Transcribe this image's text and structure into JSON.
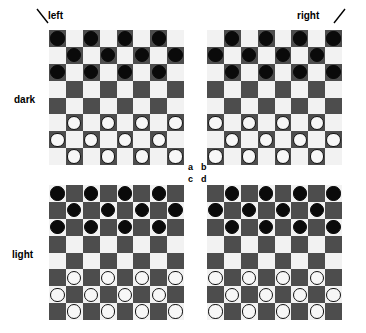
{
  "figure": {
    "row_labels": [
      "dark",
      "light"
    ],
    "col_labels": [
      "left",
      "right"
    ],
    "quadrant_labels": [
      "a",
      "b",
      "c",
      "d"
    ],
    "colors": {
      "light_square": "#f2f2f2",
      "dark_square": "#4d4d4d",
      "black_piece": "#0a0a0a",
      "white_piece": "#f7f7f7",
      "piece_outline": "#111111",
      "background": "#ffffff",
      "text": "#000000"
    }
  },
  "boards": [
    {
      "id": "a",
      "row_group": "dark",
      "col_group": "left",
      "size": 8,
      "corner_square": "dark",
      "squares": [
        [
          "dark",
          "light",
          "dark",
          "light",
          "dark",
          "light",
          "dark",
          "light"
        ],
        [
          "light",
          "dark",
          "light",
          "dark",
          "light",
          "dark",
          "light",
          "dark"
        ],
        [
          "dark",
          "light",
          "dark",
          "light",
          "dark",
          "light",
          "dark",
          "light"
        ],
        [
          "light",
          "dark",
          "light",
          "dark",
          "light",
          "dark",
          "light",
          "dark"
        ],
        [
          "dark",
          "light",
          "dark",
          "light",
          "dark",
          "light",
          "dark",
          "light"
        ],
        [
          "light",
          "dark",
          "light",
          "dark",
          "light",
          "dark",
          "light",
          "dark"
        ],
        [
          "dark",
          "light",
          "dark",
          "light",
          "dark",
          "light",
          "dark",
          "light"
        ],
        [
          "light",
          "dark",
          "light",
          "dark",
          "light",
          "dark",
          "light",
          "dark"
        ]
      ],
      "pieces": [
        [
          "black",
          "",
          "black",
          "",
          "black",
          "",
          "black",
          ""
        ],
        [
          "",
          "black",
          "",
          "black",
          "",
          "black",
          "",
          "black"
        ],
        [
          "black",
          "",
          "black",
          "",
          "black",
          "",
          "black",
          ""
        ],
        [
          "",
          "",
          "",
          "",
          "",
          "",
          "",
          ""
        ],
        [
          "",
          "",
          "",
          "",
          "",
          "",
          "",
          ""
        ],
        [
          "",
          "white",
          "",
          "white",
          "",
          "white",
          "",
          "white"
        ],
        [
          "white",
          "",
          "white",
          "",
          "white",
          "",
          "white",
          ""
        ],
        [
          "",
          "white",
          "",
          "white",
          "",
          "white",
          "",
          "white"
        ]
      ]
    },
    {
      "id": "b",
      "row_group": "dark",
      "col_group": "right",
      "size": 8,
      "corner_square": "light",
      "squares": [
        [
          "light",
          "dark",
          "light",
          "dark",
          "light",
          "dark",
          "light",
          "dark"
        ],
        [
          "dark",
          "light",
          "dark",
          "light",
          "dark",
          "light",
          "dark",
          "light"
        ],
        [
          "light",
          "dark",
          "light",
          "dark",
          "light",
          "dark",
          "light",
          "dark"
        ],
        [
          "dark",
          "light",
          "dark",
          "light",
          "dark",
          "light",
          "dark",
          "light"
        ],
        [
          "light",
          "dark",
          "light",
          "dark",
          "light",
          "dark",
          "light",
          "dark"
        ],
        [
          "dark",
          "light",
          "dark",
          "light",
          "dark",
          "light",
          "dark",
          "light"
        ],
        [
          "light",
          "dark",
          "light",
          "dark",
          "light",
          "dark",
          "light",
          "dark"
        ],
        [
          "dark",
          "light",
          "dark",
          "light",
          "dark",
          "light",
          "dark",
          "light"
        ]
      ],
      "pieces": [
        [
          "",
          "black",
          "",
          "black",
          "",
          "black",
          "",
          "black"
        ],
        [
          "black",
          "",
          "black",
          "",
          "black",
          "",
          "black",
          ""
        ],
        [
          "",
          "black",
          "",
          "black",
          "",
          "black",
          "",
          "black"
        ],
        [
          "",
          "",
          "",
          "",
          "",
          "",
          "",
          ""
        ],
        [
          "",
          "",
          "",
          "",
          "",
          "",
          "",
          ""
        ],
        [
          "white",
          "",
          "white",
          "",
          "white",
          "",
          "white",
          ""
        ],
        [
          "",
          "white",
          "",
          "white",
          "",
          "white",
          "",
          "white"
        ],
        [
          "white",
          "",
          "white",
          "",
          "white",
          "",
          "white",
          ""
        ]
      ]
    },
    {
      "id": "c",
      "row_group": "light",
      "col_group": "left",
      "size": 8,
      "corner_square": "light",
      "squares": [
        [
          "light",
          "dark",
          "light",
          "dark",
          "light",
          "dark",
          "light",
          "dark"
        ],
        [
          "dark",
          "light",
          "dark",
          "light",
          "dark",
          "light",
          "dark",
          "light"
        ],
        [
          "light",
          "dark",
          "light",
          "dark",
          "light",
          "dark",
          "light",
          "dark"
        ],
        [
          "dark",
          "light",
          "dark",
          "light",
          "dark",
          "light",
          "dark",
          "light"
        ],
        [
          "light",
          "dark",
          "light",
          "dark",
          "light",
          "dark",
          "light",
          "dark"
        ],
        [
          "dark",
          "light",
          "dark",
          "light",
          "dark",
          "light",
          "dark",
          "light"
        ],
        [
          "light",
          "dark",
          "light",
          "dark",
          "light",
          "dark",
          "light",
          "dark"
        ],
        [
          "dark",
          "light",
          "dark",
          "light",
          "dark",
          "light",
          "dark",
          "light"
        ]
      ],
      "pieces": [
        [
          "black",
          "",
          "black",
          "",
          "black",
          "",
          "black",
          ""
        ],
        [
          "",
          "black",
          "",
          "black",
          "",
          "black",
          "",
          "black"
        ],
        [
          "black",
          "",
          "black",
          "",
          "black",
          "",
          "black",
          ""
        ],
        [
          "",
          "",
          "",
          "",
          "",
          "",
          "",
          ""
        ],
        [
          "",
          "",
          "",
          "",
          "",
          "",
          "",
          ""
        ],
        [
          "",
          "white",
          "",
          "white",
          "",
          "white",
          "",
          "white"
        ],
        [
          "white",
          "",
          "white",
          "",
          "white",
          "",
          "white",
          ""
        ],
        [
          "",
          "white",
          "",
          "white",
          "",
          "white",
          "",
          "white"
        ]
      ]
    },
    {
      "id": "d",
      "row_group": "light",
      "col_group": "right",
      "size": 8,
      "corner_square": "dark",
      "squares": [
        [
          "dark",
          "light",
          "dark",
          "light",
          "dark",
          "light",
          "dark",
          "light"
        ],
        [
          "light",
          "dark",
          "light",
          "dark",
          "light",
          "dark",
          "light",
          "dark"
        ],
        [
          "dark",
          "light",
          "dark",
          "light",
          "dark",
          "light",
          "dark",
          "light"
        ],
        [
          "light",
          "dark",
          "light",
          "dark",
          "light",
          "dark",
          "light",
          "dark"
        ],
        [
          "dark",
          "light",
          "dark",
          "light",
          "dark",
          "light",
          "dark",
          "light"
        ],
        [
          "light",
          "dark",
          "light",
          "dark",
          "light",
          "dark",
          "light",
          "dark"
        ],
        [
          "dark",
          "light",
          "dark",
          "light",
          "dark",
          "light",
          "dark",
          "light"
        ],
        [
          "light",
          "dark",
          "light",
          "dark",
          "light",
          "dark",
          "light",
          "dark"
        ]
      ],
      "pieces": [
        [
          "",
          "black",
          "",
          "black",
          "",
          "black",
          "",
          "black"
        ],
        [
          "black",
          "",
          "black",
          "",
          "black",
          "",
          "black",
          ""
        ],
        [
          "",
          "black",
          "",
          "black",
          "",
          "black",
          "",
          "black"
        ],
        [
          "",
          "",
          "",
          "",
          "",
          "",
          "",
          ""
        ],
        [
          "",
          "",
          "",
          "",
          "",
          "",
          "",
          ""
        ],
        [
          "white",
          "",
          "white",
          "",
          "white",
          "",
          "white",
          ""
        ],
        [
          "",
          "white",
          "",
          "white",
          "",
          "white",
          "",
          "white"
        ],
        [
          "white",
          "",
          "white",
          "",
          "white",
          "",
          "white",
          ""
        ]
      ]
    }
  ]
}
